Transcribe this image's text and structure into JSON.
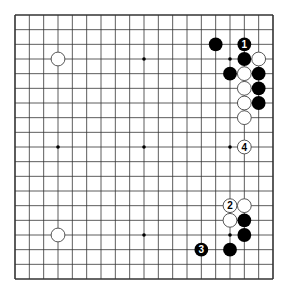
{
  "diagram": {
    "type": "go-board",
    "size": 19,
    "colors": {
      "background": "#ffffff",
      "line": "#333333",
      "black_stone": "#000000",
      "white_stone": "#ffffff",
      "white_stroke": "#444444"
    },
    "hoshi": [
      [
        3,
        3
      ],
      [
        9,
        3
      ],
      [
        15,
        3
      ],
      [
        3,
        9
      ],
      [
        9,
        9
      ],
      [
        15,
        9
      ],
      [
        3,
        15
      ],
      [
        9,
        15
      ],
      [
        15,
        15
      ]
    ],
    "stones": [
      {
        "color": "white",
        "col": 3,
        "row": 3,
        "label": ""
      },
      {
        "color": "black",
        "col": 14,
        "row": 2,
        "label": ""
      },
      {
        "color": "black",
        "col": 16,
        "row": 2,
        "label": "1"
      },
      {
        "color": "black",
        "col": 16,
        "row": 3,
        "label": ""
      },
      {
        "color": "white",
        "col": 17,
        "row": 3,
        "label": ""
      },
      {
        "color": "black",
        "col": 15,
        "row": 4,
        "label": ""
      },
      {
        "color": "white",
        "col": 16,
        "row": 4,
        "label": ""
      },
      {
        "color": "black",
        "col": 17,
        "row": 4,
        "label": ""
      },
      {
        "color": "white",
        "col": 16,
        "row": 5,
        "label": ""
      },
      {
        "color": "black",
        "col": 17,
        "row": 5,
        "label": ""
      },
      {
        "color": "white",
        "col": 16,
        "row": 6,
        "label": ""
      },
      {
        "color": "black",
        "col": 17,
        "row": 6,
        "label": ""
      },
      {
        "color": "white",
        "col": 16,
        "row": 7,
        "label": ""
      },
      {
        "color": "white",
        "col": 16,
        "row": 9,
        "label": "4"
      },
      {
        "color": "white",
        "col": 15,
        "row": 13,
        "label": "2"
      },
      {
        "color": "white",
        "col": 16,
        "row": 13,
        "label": ""
      },
      {
        "color": "white",
        "col": 15,
        "row": 14,
        "label": ""
      },
      {
        "color": "black",
        "col": 16,
        "row": 14,
        "label": ""
      },
      {
        "color": "black",
        "col": 16,
        "row": 15,
        "label": ""
      },
      {
        "color": "black",
        "col": 13,
        "row": 16,
        "label": "3"
      },
      {
        "color": "black",
        "col": 15,
        "row": 16,
        "label": ""
      },
      {
        "color": "white",
        "col": 3,
        "row": 15,
        "label": ""
      }
    ]
  }
}
